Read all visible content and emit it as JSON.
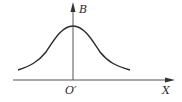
{
  "diagram": {
    "type": "bell-curve-field-distribution",
    "axes": {
      "vertical_label": "B",
      "horizontal_label": "X",
      "origin_label": "O′"
    },
    "curve": {
      "shape": "symmetric bell curve peaked at origin",
      "color": "#2a2a2a"
    },
    "colors": {
      "axis": "#555555",
      "curve": "#2a2a2a",
      "background": "#ffffff"
    }
  }
}
